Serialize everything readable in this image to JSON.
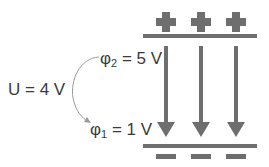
{
  "diagram": {
    "colors": {
      "plate": "#6e6e6e",
      "arrow": "#6e6e6e",
      "text": "#3a3a3a",
      "curve": "#9a9a9a",
      "background": "#ffffff"
    },
    "top_plate": {
      "charge_symbol": "+",
      "charge_count": 3,
      "potential_label": {
        "symbol": "φ",
        "subscript": "2",
        "rest": " = 5 V"
      }
    },
    "bottom_plate": {
      "charge_symbol": "−",
      "charge_count": 3,
      "potential_label": {
        "symbol": "φ",
        "subscript": "1",
        "rest": " = 1 V"
      }
    },
    "voltage_label": "U = 4 V",
    "field_lines": {
      "count": 3,
      "direction": "down"
    }
  }
}
